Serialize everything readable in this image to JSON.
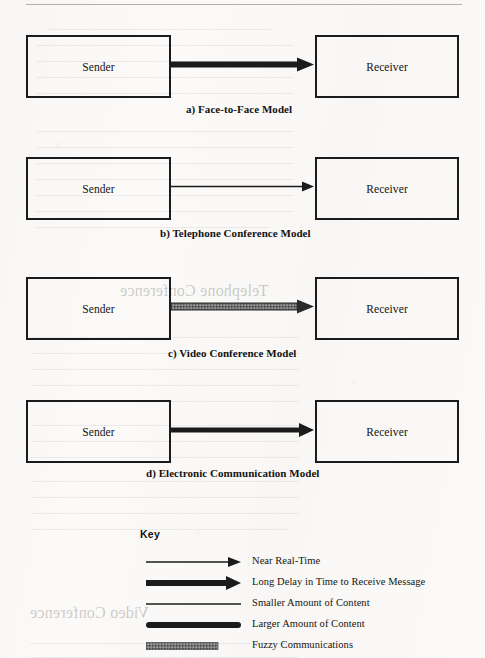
{
  "page": {
    "background_color": "#fbfaf8",
    "ink_color": "#1b1b1b",
    "fuzzy_color": "#6e6e6e"
  },
  "models": [
    {
      "id": "face-to-face",
      "sender_label": "Sender",
      "receiver_label": "Receiver",
      "caption": "a) Face-to-Face Model",
      "arrow_style": "thick-solid-black",
      "arrow_meaning": "Larger Amount of Content, Near Real-Time"
    },
    {
      "id": "telephone-conference",
      "sender_label": "Sender",
      "receiver_label": "Receiver",
      "caption": "b) Telephone Conference Model",
      "arrow_style": "thin-solid-black",
      "arrow_meaning": "Smaller Amount of Content, Near Real-Time"
    },
    {
      "id": "video-conference",
      "sender_label": "Sender",
      "receiver_label": "Receiver",
      "caption": "c) Video Conference Model",
      "arrow_style": "thick-fuzzy-gray",
      "arrow_meaning": "Fuzzy Communications"
    },
    {
      "id": "electronic-communication",
      "sender_label": "Sender",
      "receiver_label": "Receiver",
      "caption": "d) Electronic Communication Model",
      "arrow_style": "medium-solid-black",
      "arrow_meaning": "Long Delay in Time to Receive Message"
    }
  ],
  "key": {
    "title": "Key",
    "entries": [
      {
        "style": "thin-arrow",
        "label": "Near Real-Time"
      },
      {
        "style": "thick-arrow",
        "label": "Long Delay in Time to Receive Message"
      },
      {
        "style": "thin-line",
        "label": "Smaller Amount of Content"
      },
      {
        "style": "thick-line",
        "label": "Larger Amount of Content"
      },
      {
        "style": "fuzzy-bar",
        "label": "Fuzzy Communications"
      }
    ]
  },
  "bleed_through": {
    "lines": [
      "Telephone Conference",
      "Video Conference"
    ]
  }
}
